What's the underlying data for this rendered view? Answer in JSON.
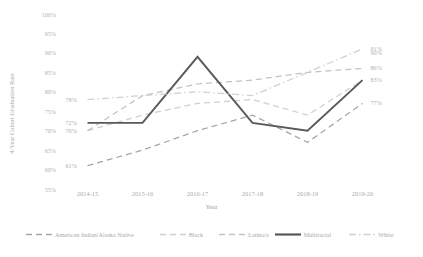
{
  "chart_data": {
    "type": "line",
    "title": "",
    "xlabel": "Year",
    "ylabel": "4-Year Cohort Graduation Rate",
    "categories": [
      "2014-15",
      "2015-16",
      "2016-17",
      "2017-18",
      "2018-19",
      "2019-20"
    ],
    "ylim": [
      55,
      100
    ],
    "yticks": [
      "55%",
      "60%",
      "65%",
      "70%",
      "75%",
      "80%",
      "85%",
      "90%",
      "95%",
      "100%"
    ],
    "ytick_values": [
      55,
      60,
      65,
      70,
      75,
      80,
      85,
      90,
      95,
      100
    ],
    "grid": false,
    "legend_position": "bottom",
    "series": [
      {
        "name": "American Indian/Alaska Native",
        "style": "dashed",
        "color": "#a6a6a6",
        "values": [
          61,
          65,
          70,
          74,
          67,
          77
        ]
      },
      {
        "name": "Black",
        "style": "dashed",
        "color": "#cfcfcf",
        "values": [
          70,
          74,
          77,
          78,
          74,
          83
        ]
      },
      {
        "name": "Latino/a",
        "style": "dashed",
        "color": "#c2c2c2",
        "values": [
          70,
          79,
          82,
          83,
          85,
          86
        ]
      },
      {
        "name": "Multiracial",
        "style": "solid",
        "color": "#595959",
        "values": [
          72,
          72,
          89,
          72,
          70,
          83
        ]
      },
      {
        "name": "White",
        "style": "dashdot",
        "color": "#d0d0d0",
        "values": [
          78,
          79,
          80,
          79,
          85,
          91
        ]
      }
    ],
    "point_labels_left": [
      {
        "text": "78%",
        "value": 78
      },
      {
        "text": "72%",
        "value": 72
      },
      {
        "text": "70%",
        "value": 70
      },
      {
        "text": "61%",
        "value": 61
      }
    ],
    "point_labels_right": [
      {
        "text": "91%",
        "value": 91
      },
      {
        "text": "90%",
        "value": 90
      },
      {
        "text": "86%",
        "value": 86
      },
      {
        "text": "83%",
        "value": 83
      },
      {
        "text": "77%",
        "value": 77
      }
    ]
  },
  "legend": {
    "items": [
      {
        "label": "American Indian/Alaska Native"
      },
      {
        "label": "Black"
      },
      {
        "label": "Latino/a"
      },
      {
        "label": "Multiracial"
      },
      {
        "label": "White"
      }
    ]
  }
}
